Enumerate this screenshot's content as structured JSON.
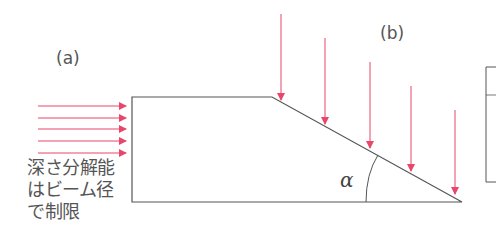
{
  "diagram": {
    "labels": {
      "panel_a": "(a)",
      "panel_b": "(b)",
      "angle": "α"
    },
    "caption_a": {
      "lines": [
        "深さ分解能",
        "はビーム径",
        "で制限"
      ]
    },
    "colors": {
      "beam": "#e8466a",
      "outline": "#555555",
      "text": "#555555"
    },
    "beams_a": {
      "count": 5,
      "direction": "horizontal-right"
    },
    "beams_b": {
      "count": 5,
      "direction": "vertical-down"
    }
  }
}
